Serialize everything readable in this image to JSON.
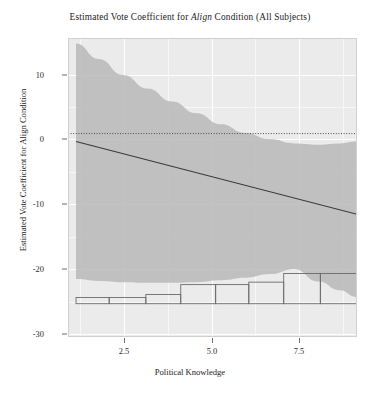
{
  "chart_data": {
    "type": "line",
    "title": "Estimated Vote Coefficient for Align Condition (All Subjects)",
    "title_prefix": "Estimated Vote Coefficient for ",
    "title_italic": "Align",
    "title_suffix": " Condition (All Subjects)",
    "xlabel": "Political Knowledge",
    "ylabel": "Estimated Vote Coefficient for Align Condition",
    "xlim": [
      0.72,
      9.0
    ],
    "ylim": [
      -33.0,
      15.5
    ],
    "xticks": [
      2.5,
      5.0,
      7.5
    ],
    "xtick_labels": [
      "2.5",
      "5.0",
      "7.5"
    ],
    "yticks": [
      10,
      0,
      -10,
      -20,
      -30
    ],
    "ytick_labels": [
      "10",
      "0",
      "-10",
      "-20",
      "-30"
    ],
    "grid": true,
    "legend": "none",
    "panel_background": "#ebebeb",
    "band_color": "#b3b3b3",
    "line_color": "#3a3a3a",
    "zero_line_color": "#4d4d4d",
    "hist_stroke": "#6b6b6b",
    "series": [
      {
        "name": "fitted regression line",
        "style": "solid",
        "x": [
          0.95,
          9.0
        ],
        "y": [
          -1.3,
          -13.1
        ]
      },
      {
        "name": "zero reference line",
        "style": "dotted",
        "x": [
          0.72,
          9.0
        ],
        "y": [
          0,
          0
        ]
      }
    ],
    "confidence_band": {
      "name": "95% confidence interval",
      "x": [
        0.95,
        1.6,
        2.3,
        3.0,
        3.7,
        4.4,
        5.1,
        5.8,
        6.5,
        7.2,
        7.9,
        8.5,
        9.0
      ],
      "upper": [
        14.6,
        12.1,
        9.5,
        7.3,
        5.2,
        3.3,
        1.5,
        0.1,
        -0.9,
        -1.6,
        -1.8,
        -1.6,
        -1.3
      ],
      "lower": [
        -23.6,
        -23.9,
        -24.1,
        -24.2,
        -24.2,
        -24.1,
        -23.8,
        -23.4,
        -22.8,
        -22.0,
        -24.0,
        -25.4,
        -26.5
      ]
    },
    "histogram": {
      "name": "Political Knowledge distribution",
      "baseline": -27.6,
      "bins": [
        {
          "x0": 0.95,
          "x1": 1.9,
          "top": -26.6
        },
        {
          "x0": 1.9,
          "x1": 2.95,
          "top": -26.6
        },
        {
          "x0": 2.95,
          "x1": 3.95,
          "top": -26.1
        },
        {
          "x0": 3.95,
          "x1": 4.95,
          "top": -24.5
        },
        {
          "x0": 4.95,
          "x1": 5.9,
          "top": -24.5
        },
        {
          "x0": 5.9,
          "x1": 6.9,
          "top": -24.1
        },
        {
          "x0": 6.9,
          "x1": 7.95,
          "top": -22.7
        },
        {
          "x0": 7.95,
          "x1": 9.0,
          "top": -22.7
        }
      ]
    }
  }
}
